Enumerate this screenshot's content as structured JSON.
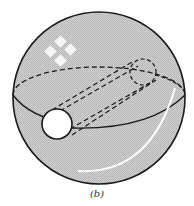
{
  "figure": {
    "caption": "(b)",
    "colors": {
      "sphere_fill": "#c9c9c9",
      "outline": "#1a1a1a",
      "hole_fill": "#ffffff",
      "highlight": "#ffffff"
    },
    "elements": {
      "sphere": {
        "cx": 99,
        "cy": 98,
        "r": 86
      },
      "equator": {
        "cx": 99,
        "cy": 95,
        "rx": 86,
        "ry": 28
      },
      "front_hole": {
        "cx": 57,
        "cy": 124,
        "r": 15
      },
      "back_hole": {
        "cx": 143,
        "cy": 72,
        "r": 13
      }
    }
  }
}
